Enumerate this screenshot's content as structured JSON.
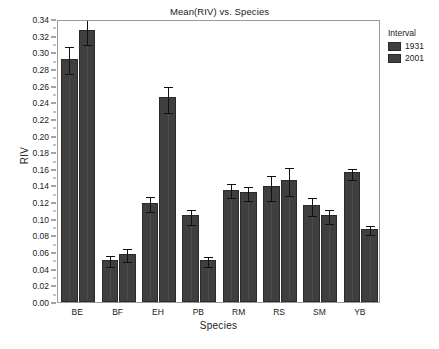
{
  "chart_data": {
    "type": "bar",
    "title": "Mean(RIV) vs. Species",
    "xlabel": "Species",
    "ylabel": "RIV",
    "categories": [
      "BE",
      "BF",
      "EH",
      "PB",
      "RM",
      "RS",
      "SM",
      "YB"
    ],
    "ylim": [
      0.0,
      0.34
    ],
    "ytick_step": 0.02,
    "ytick_labels": [
      "0.00",
      "0.02",
      "0.04",
      "0.06",
      "0.08",
      "0.10",
      "0.12",
      "0.14",
      "0.16",
      "0.18",
      "0.20",
      "0.22",
      "0.24",
      "0.26",
      "0.28",
      "0.30",
      "0.32",
      "0.34"
    ],
    "grid": false,
    "legend_position": "right",
    "legend_title": "Interval",
    "series": [
      {
        "name": "1931",
        "color": "#3f3f3f",
        "values": [
          0.292,
          0.051,
          0.119,
          0.104,
          0.135,
          0.139,
          0.116,
          0.156
        ],
        "err_low": [
          0.276,
          0.044,
          0.11,
          0.095,
          0.127,
          0.124,
          0.106,
          0.149
        ],
        "err_high": [
          0.309,
          0.058,
          0.128,
          0.113,
          0.144,
          0.154,
          0.127,
          0.162
        ]
      },
      {
        "name": "2001",
        "color": "#3f3f3f",
        "values": [
          0.327,
          0.058,
          0.246,
          0.051,
          0.132,
          0.147,
          0.105,
          0.088
        ],
        "err_low": [
          0.311,
          0.05,
          0.23,
          0.045,
          0.124,
          0.13,
          0.096,
          0.083
        ],
        "err_high": [
          0.342,
          0.066,
          0.261,
          0.057,
          0.14,
          0.163,
          0.113,
          0.094
        ]
      }
    ]
  }
}
